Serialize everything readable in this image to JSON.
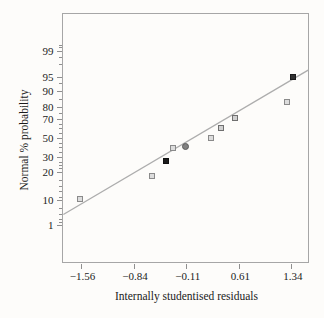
{
  "chart_data": {
    "type": "scatter",
    "title": "",
    "xlabel": "Internally studentised residuals",
    "ylabel": "Normal % probability",
    "x_axis": {
      "ticks": [
        {
          "label": "−1.56",
          "value": -1.56,
          "frac": 0.0772
        },
        {
          "label": "−0.84",
          "value": -0.84,
          "frac": 0.2907
        },
        {
          "label": "−0.11",
          "value": -0.11,
          "frac": 0.5049
        },
        {
          "label": "0.61",
          "value": 0.61,
          "frac": 0.7187
        },
        {
          "label": "1.34",
          "value": 1.34,
          "frac": 0.9325
        }
      ],
      "range_note": "linear scale"
    },
    "y_axis": {
      "scale": "normal-probability",
      "ticks": [
        {
          "label": "99",
          "pct": 99,
          "frac": 0.1486
        },
        {
          "label": "95",
          "pct": 95,
          "frac": 0.257
        },
        {
          "label": "90",
          "pct": 90,
          "frac": 0.3112
        },
        {
          "label": "80",
          "pct": 80,
          "frac": 0.3775
        },
        {
          "label": "70",
          "pct": 70,
          "frac": 0.4237
        },
        {
          "label": "50",
          "pct": 50,
          "frac": 0.498
        },
        {
          "label": "30",
          "pct": 30,
          "frac": 0.5783
        },
        {
          "label": "20",
          "pct": 20,
          "frac": 0.6365
        },
        {
          "label": "10",
          "pct": 10,
          "frac": 0.747
        },
        {
          "label": "1",
          "pct": 1,
          "frac": 0.8494
        }
      ],
      "minor_tick_pcts": [
        2,
        3,
        5,
        7,
        11,
        13,
        15,
        17,
        23,
        25,
        27,
        35,
        40,
        45,
        55,
        60,
        65,
        75,
        85,
        93,
        97,
        98,
        99.5,
        99.8
      ]
    },
    "points": [
      {
        "x": -1.58,
        "pct": 10.3,
        "marker": "square",
        "shade": "light"
      },
      {
        "x": -0.59,
        "pct": 18.7,
        "marker": "square",
        "shade": "light"
      },
      {
        "x": -0.4,
        "pct": 27.9,
        "marker": "square",
        "shade": "black"
      },
      {
        "x": -0.3,
        "pct": 40.3,
        "marker": "square",
        "shade": "light"
      },
      {
        "x": -0.12,
        "pct": 41.3,
        "marker": "circle",
        "shade": "dark"
      },
      {
        "x": 0.23,
        "pct": 49.7,
        "marker": "square",
        "shade": "light"
      },
      {
        "x": 0.36,
        "pct": 61.1,
        "marker": "square",
        "shade": "medium"
      },
      {
        "x": 0.55,
        "pct": 71.6,
        "marker": "square",
        "shade": "medium"
      },
      {
        "x": 1.27,
        "pct": 83.8,
        "marker": "square",
        "shade": "light"
      },
      {
        "x": 1.36,
        "pct": 95.1,
        "marker": "square",
        "shade": "darkest"
      }
    ],
    "fit_line": {
      "x1": -1.81,
      "pct1": 4.9,
      "x2": 1.57,
      "pct2": 96.2
    },
    "legend": null,
    "grid": false
  },
  "style": {
    "frame_color": "#a6a6a6",
    "tick_color": "#8f8f8f",
    "text_color": "#1c1c1c",
    "fit_line_color": "#adadad",
    "background": "#fdfcfa",
    "markers": {
      "light": {
        "fill": "#dcdcdc",
        "stroke": "#8a8a8a"
      },
      "medium": {
        "fill": "#d0d0d0",
        "stroke": "#6f6f6f"
      },
      "dark": {
        "fill": "#828282",
        "stroke": "#5c5c5c"
      },
      "darkest": {
        "fill": "#303030",
        "stroke": "#1a1a1a"
      },
      "black": {
        "fill": "#1c1c1c",
        "stroke": "#111111"
      }
    }
  }
}
